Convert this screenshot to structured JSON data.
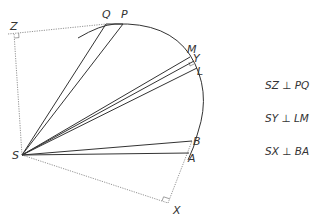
{
  "diagram": {
    "type": "geometry-orbit-sectors",
    "colors": {
      "line": "#333333",
      "dotted": "#777777",
      "text": "#333333",
      "background": "#ffffff"
    },
    "points": {
      "S": {
        "label": "S",
        "x": 22,
        "y": 155
      },
      "Z": {
        "label": "Z",
        "x": 14,
        "y": 33
      },
      "Q": {
        "label": "Q",
        "x": 106,
        "y": 24
      },
      "P": {
        "label": "P",
        "x": 123,
        "y": 24
      },
      "M": {
        "label": "M",
        "x": 190,
        "y": 55
      },
      "Y": {
        "label": "Y",
        "x": 194,
        "y": 61
      },
      "L": {
        "label": "L",
        "x": 197,
        "y": 68
      },
      "B": {
        "label": "B",
        "x": 192,
        "y": 141
      },
      "A": {
        "label": "A",
        "x": 189,
        "y": 153
      },
      "X": {
        "label": "X",
        "x": 168,
        "y": 203
      }
    },
    "relations": [
      {
        "text": "SZ ⊥ PQ"
      },
      {
        "text": "SY ⊥ LM"
      },
      {
        "text": "SX ⊥ BA"
      }
    ]
  }
}
